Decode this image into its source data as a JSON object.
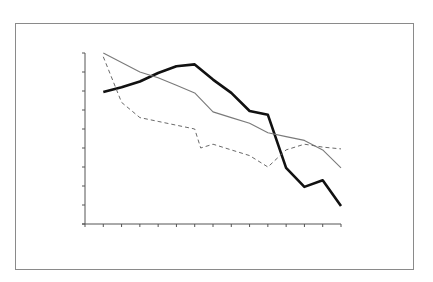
{
  "chart_data": {
    "type": "line",
    "title": "",
    "xlabel": "",
    "ylabel": "",
    "x_tick_count": 15,
    "y_tick_count": 10,
    "ylim": [
      0,
      9
    ],
    "grid": false,
    "legend": null,
    "x": [
      1,
      2,
      3,
      4,
      5,
      6,
      7,
      8,
      9,
      10,
      11,
      12,
      13,
      14
    ],
    "series": [
      {
        "name": "thick-black",
        "style": "solid",
        "color": "#111111",
        "width": 2.6,
        "x": [
          1,
          2,
          3,
          4,
          5,
          6,
          7,
          8,
          9,
          10,
          11,
          12,
          13,
          14
        ],
        "values": [
          6.95,
          7.2,
          7.5,
          7.95,
          8.3,
          8.4,
          7.6,
          6.9,
          5.95,
          5.75,
          2.95,
          1.95,
          2.3,
          0.95
        ]
      },
      {
        "name": "thin-gray",
        "style": "solid",
        "color": "#7a7a7a",
        "width": 1.1,
        "x": [
          1,
          2,
          3,
          4,
          5,
          6,
          7,
          8,
          9,
          10,
          11,
          12,
          13,
          14
        ],
        "values": [
          9.0,
          8.5,
          8.0,
          7.7,
          7.3,
          6.9,
          5.9,
          5.6,
          5.3,
          4.8,
          4.6,
          4.4,
          3.9,
          2.95
        ]
      },
      {
        "name": "dashed-gray",
        "style": "dashed",
        "color": "#6a6a6a",
        "width": 1.0,
        "x": [
          1,
          2,
          3,
          4,
          5,
          6,
          6.33,
          7,
          8,
          9,
          10,
          11,
          12,
          13,
          14
        ],
        "values": [
          8.8,
          6.4,
          5.6,
          5.4,
          5.2,
          5.0,
          4.0,
          4.2,
          3.9,
          3.6,
          3.0,
          3.9,
          4.2,
          4.05,
          3.95
        ]
      }
    ]
  },
  "layout": {
    "frame_color": "#8a8a8a",
    "axis_color": "#555555"
  }
}
